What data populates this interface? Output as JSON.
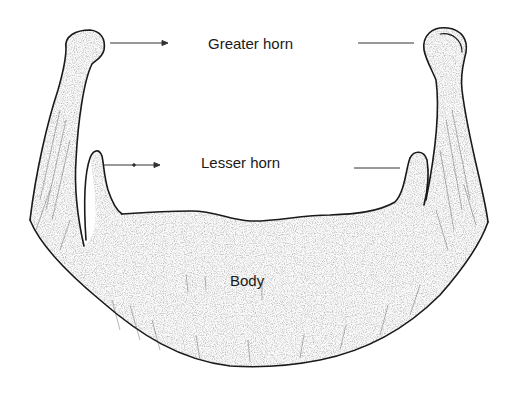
{
  "diagram": {
    "labels": {
      "greater_horn": "Greater horn",
      "lesser_horn": "Lesser horn",
      "body": "Body"
    },
    "parts": [
      {
        "id": "greater_horn_left",
        "label_ref": "greater_horn"
      },
      {
        "id": "greater_horn_right",
        "label_ref": "greater_horn"
      },
      {
        "id": "lesser_horn_left",
        "label_ref": "lesser_horn"
      },
      {
        "id": "lesser_horn_right",
        "label_ref": "lesser_horn"
      },
      {
        "id": "body",
        "label_ref": "body"
      }
    ],
    "colors": {
      "outline": "#1a1a1a",
      "shading": "#555555",
      "background": "#ffffff"
    }
  }
}
